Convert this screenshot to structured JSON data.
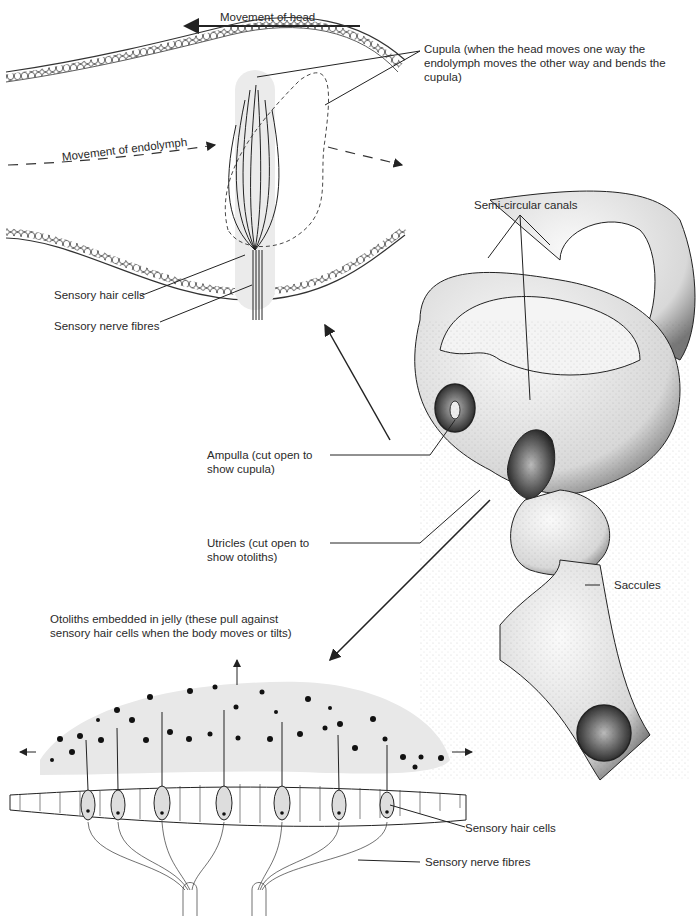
{
  "diagram": {
    "top_panel": {
      "head_movement_label": "Movement of head",
      "endolymph_label": "Movement of endolymph",
      "cupula_label": "Cupula (when the head moves one way the endolymph moves the other way and bends the cupula)",
      "hair_cells_label": "Sensory hair cells",
      "nerve_fibres_label": "Sensory nerve fibres"
    },
    "center_panel": {
      "canals_label": "Semi-circular canals",
      "ampulla_label": "Ampulla (cut open to show cupula)",
      "utricles_label": "Utricles (cut open to show otoliths)",
      "saccules_label": "Saccules"
    },
    "bottom_panel": {
      "otoliths_label": "Otoliths embedded in jelly (these pull against sensory hair cells when the body moves or tilts)",
      "hair_cells_label": "Sensory hair cells",
      "nerve_fibres_label": "Sensory nerve fibres"
    },
    "colors": {
      "ink": "#222222",
      "jelly": "#e6e6e6",
      "background": "#ffffff"
    }
  }
}
